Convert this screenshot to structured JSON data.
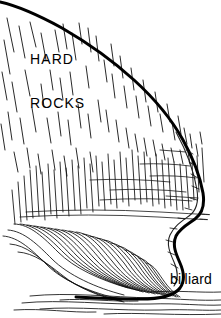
{
  "figure": {
    "type": "line-art-illustration",
    "width": 221,
    "height": 318,
    "background_color": "#ffffff",
    "ink_color": "#000000"
  },
  "labels": {
    "hard": "HARD",
    "rocks": "ROCKS",
    "billiard": "billiard"
  },
  "colors": {
    "ink": "#000000",
    "background": "#ffffff",
    "hatch": "#1a1a1a"
  },
  "icons": {
    "cliff_outline": "cliff-outline-icon",
    "hatching": "rock-hatching-icon",
    "water_lines": "water-flow-lines-icon"
  }
}
